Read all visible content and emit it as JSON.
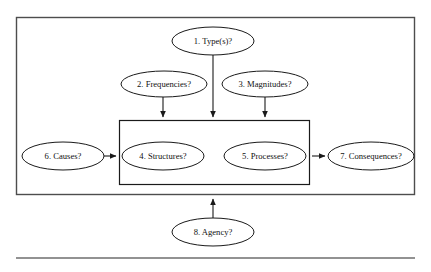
{
  "figure": {
    "canvas": {
      "width": 431,
      "height": 272,
      "background": "#ffffff"
    },
    "colors": {
      "node_stroke": "#1a1a1a",
      "node_fill": "#ffffff",
      "text": "#111111",
      "outer_frame": "#4d4d4d",
      "inner_frame": "#1a1a1a",
      "arrow": "#1a1a1a",
      "rule": "#6e6e6e"
    },
    "outer_frame": {
      "x": 16,
      "y": 17,
      "width": 399,
      "height": 178
    },
    "inner_frame": {
      "x": 119,
      "y": 120,
      "width": 191,
      "height": 65
    },
    "bottom_rule": {
      "x1": 16,
      "y1": 258,
      "x2": 415,
      "y2": 258
    },
    "nodes": [
      {
        "id": "type",
        "label": "1. Type(s)?",
        "cx": 213,
        "cy": 41,
        "rx": 41,
        "ry": 14
      },
      {
        "id": "frequencies",
        "label": "2. Frequencies?",
        "cx": 164,
        "cy": 84,
        "rx": 43,
        "ry": 13
      },
      {
        "id": "magnitudes",
        "label": "3. Magnitudes?",
        "cx": 265,
        "cy": 84,
        "rx": 43,
        "ry": 13
      },
      {
        "id": "structures",
        "label": "4. Structures?",
        "cx": 163,
        "cy": 156,
        "rx": 41,
        "ry": 14
      },
      {
        "id": "processes",
        "label": "5. Processes?",
        "cx": 265,
        "cy": 156,
        "rx": 41,
        "ry": 14
      },
      {
        "id": "causes",
        "label": "6. Causes?",
        "cx": 63,
        "cy": 156,
        "rx": 41,
        "ry": 14
      },
      {
        "id": "consequences",
        "label": "7. Consequences?",
        "cx": 371,
        "cy": 156,
        "rx": 43,
        "ry": 14
      },
      {
        "id": "agency",
        "label": "8. Agency?",
        "cx": 213,
        "cy": 232,
        "rx": 41,
        "ry": 14
      }
    ],
    "arrows": [
      {
        "id": "type-to-box",
        "from": "type",
        "to": "inner-frame",
        "direction": "down",
        "x1": 213,
        "y1": 55,
        "x2": 213,
        "y2": 118
      },
      {
        "id": "frequencies-to-box",
        "from": "frequencies",
        "to": "inner-frame",
        "direction": "down",
        "x1": 163,
        "y1": 97,
        "x2": 163,
        "y2": 118
      },
      {
        "id": "magnitudes-to-box",
        "from": "magnitudes",
        "to": "inner-frame",
        "direction": "down",
        "x1": 265,
        "y1": 97,
        "x2": 265,
        "y2": 118
      },
      {
        "id": "causes-to-box",
        "from": "causes",
        "to": "inner-frame",
        "direction": "right",
        "x1": 105,
        "y1": 156,
        "x2": 117,
        "y2": 156
      },
      {
        "id": "box-to-consequences",
        "from": "inner-frame",
        "to": "consequences",
        "direction": "right",
        "x1": 312,
        "y1": 156,
        "x2": 326,
        "y2": 156
      },
      {
        "id": "agency-to-box",
        "from": "agency",
        "to": "inner-frame",
        "direction": "up",
        "x1": 213,
        "y1": 218,
        "x2": 213,
        "y2": 198
      }
    ]
  }
}
